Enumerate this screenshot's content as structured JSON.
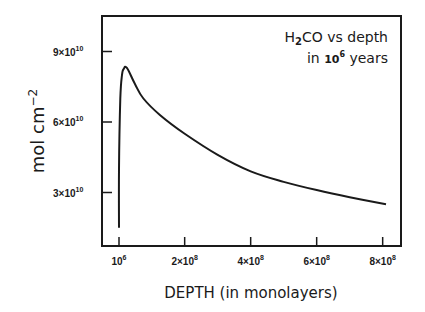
{
  "chart_data": {
    "type": "line",
    "title": "",
    "annotation": {
      "line1_prefix": "H",
      "line1_sub": "2",
      "line1_suffix": "CO vs depth",
      "line2_prefix": "in ",
      "line2_base": "10",
      "line2_exp": "6",
      "line2_suffix": "  years"
    },
    "xlabel": "DEPTH (in monolayers)",
    "ylabel": "mol cm",
    "ylabel_exp": "−2",
    "x_ticks": [
      {
        "base": "10",
        "exp": "6",
        "value": 1000000
      },
      {
        "base": "2×10",
        "exp": "8",
        "value": 200000000
      },
      {
        "base": "4×10",
        "exp": "8",
        "value": 400000000
      },
      {
        "base": "6×10",
        "exp": "8",
        "value": 600000000
      },
      {
        "base": "8×10",
        "exp": "8",
        "value": 800000000
      }
    ],
    "y_ticks": [
      {
        "base": "3×10",
        "exp": "10",
        "value": 30000000000
      },
      {
        "base": "6×10",
        "exp": "10",
        "value": 60000000000
      },
      {
        "base": "9×10",
        "exp": "10",
        "value": 90000000000
      }
    ],
    "xlim": [
      -50000000,
      850000000
    ],
    "ylim": [
      7000000000,
      105000000000
    ],
    "grid": false,
    "legend": "none",
    "series": [
      {
        "name": "H2CO",
        "x": [
          1000000,
          1000000,
          5000000,
          10000000,
          15000000,
          25000000,
          50000000,
          75000000,
          125000000,
          200000000,
          300000000,
          400000000,
          500000000,
          600000000,
          700000000,
          810000000
        ],
        "y": [
          15000000000,
          40000000000,
          70000000000,
          80000000000,
          82500000000,
          83000000000,
          76000000000,
          70000000000,
          63000000000,
          55000000000,
          46000000000,
          39000000000,
          34500000000,
          31000000000,
          28000000000,
          25000000000
        ]
      }
    ]
  }
}
